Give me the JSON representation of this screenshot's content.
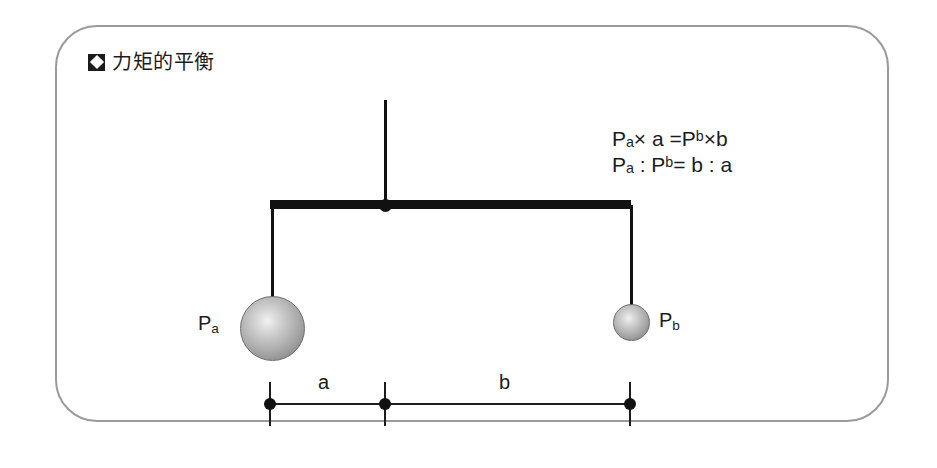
{
  "panel": {
    "title": {
      "icon": "diamond-in-square-icon",
      "text": "力矩的平衡"
    },
    "border_color": "#9a9a9a"
  },
  "formulas": [
    {
      "id": "moment-equation",
      "lhs_symbol": "P",
      "lhs_sub": "a",
      "text": "Pₐ× a =Pᵇ×b"
    },
    {
      "id": "ratio-equation",
      "text": "Pₐ : Pᵇ= b : a"
    }
  ],
  "diagram": {
    "type": "lever-balance",
    "support_rod": {
      "name": "support-rod"
    },
    "beam": {
      "name": "balance-beam"
    },
    "pivot": {
      "name": "pivot-point"
    },
    "masses": [
      {
        "id": "mass-a",
        "label": "P",
        "sub": "a",
        "size": "large",
        "side": "left"
      },
      {
        "id": "mass-b",
        "label": "P",
        "sub": "b",
        "size": "small",
        "side": "right"
      }
    ],
    "dimensions": [
      {
        "id": "distance-a",
        "label": "a",
        "from": "left-tick",
        "to": "center-tick"
      },
      {
        "id": "distance-b",
        "label": "b",
        "from": "center-tick",
        "to": "right-tick"
      }
    ],
    "colors": {
      "line": "#111111",
      "sphere_highlight": "#f2f2f2",
      "sphere_shadow": "#7b7b7b"
    }
  }
}
